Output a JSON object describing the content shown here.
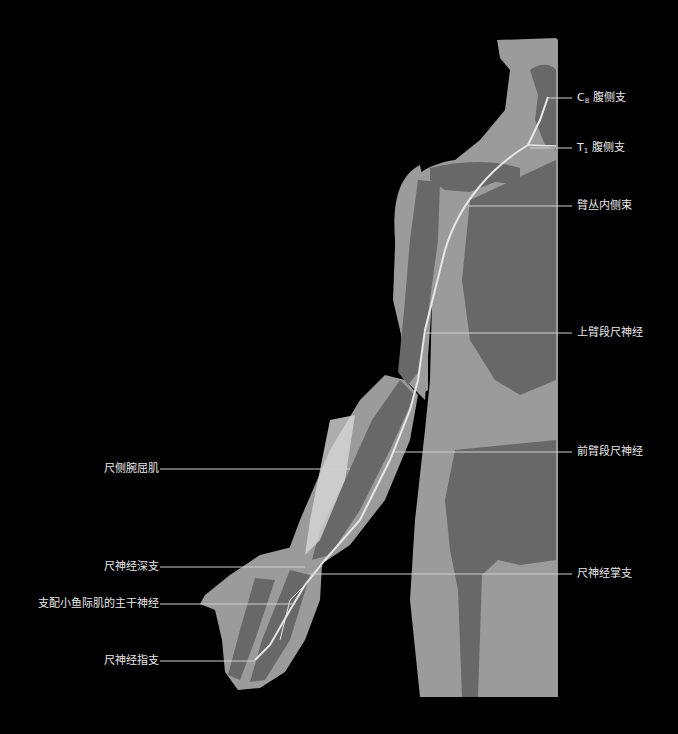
{
  "diagram": {
    "type": "anatomical-illustration",
    "colors": {
      "background": "#000000",
      "soft_tissue": "#9b9b9b",
      "bone": "#686868",
      "nerve": "#e6e6e6",
      "leader_line": "#cfcfcf",
      "text": "#e8e8e8"
    },
    "labels_right": [
      {
        "id": "c8",
        "prefix": "C",
        "sub": "8",
        "text": " 腹侧支",
        "y": 98
      },
      {
        "id": "t1",
        "prefix": "T",
        "sub": "1",
        "text": " 腹侧支",
        "y": 148
      },
      {
        "id": "medial-cord",
        "prefix": "",
        "sub": "",
        "text": "臂丛内侧束",
        "y": 206
      },
      {
        "id": "upper-arm-ulnar",
        "prefix": "",
        "sub": "",
        "text": "上臂段尺神经",
        "y": 332
      },
      {
        "id": "forearm-ulnar",
        "prefix": "",
        "sub": "",
        "text": "前臂段尺神经",
        "y": 452
      },
      {
        "id": "palmar-branch",
        "prefix": "",
        "sub": "",
        "text": "尺神经掌支",
        "y": 574
      }
    ],
    "labels_left": [
      {
        "id": "fcu",
        "text": "尺侧腕屈肌",
        "y": 469
      },
      {
        "id": "deep-branch",
        "text": "尺神经深支",
        "y": 567
      },
      {
        "id": "hypothenar-trunk",
        "text": "支配小鱼际肌的主干神经",
        "y": 604
      },
      {
        "id": "digital-branch",
        "text": "尺神经指支",
        "y": 661
      }
    ]
  }
}
